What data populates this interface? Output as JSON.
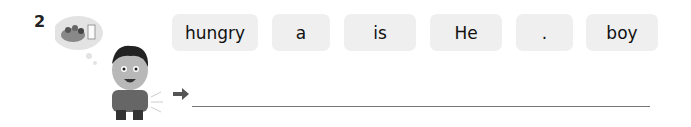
{
  "question": {
    "number": "2",
    "words": [
      "hungry",
      "a",
      "is",
      "He",
      ".",
      "boy"
    ],
    "illustration": "hungry-boy-thinking-of-food",
    "answer_arrow": "arrow-right-icon",
    "answer_value": ""
  }
}
